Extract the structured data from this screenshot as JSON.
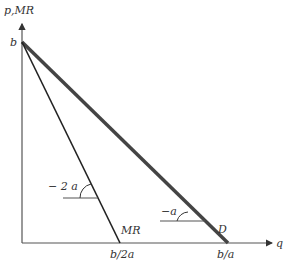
{
  "diagram": {
    "y_axis_label": "p,MR",
    "x_axis_label": "q",
    "intercept_label": "b",
    "mr_label": "MR",
    "d_label": "D",
    "mr_x_intercept": "b/2a",
    "d_x_intercept": "b/a",
    "mr_slope_label": "− 2 a",
    "d_slope_label": "−a",
    "colors": {
      "axis": "#555555",
      "line": "#222222",
      "demand": "#444444"
    }
  }
}
